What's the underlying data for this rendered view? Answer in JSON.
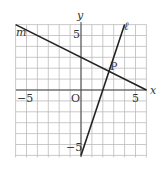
{
  "chart_data": {
    "type": "line",
    "title": "",
    "xlabel": "x",
    "ylabel": "y",
    "xlim": [
      -6,
      6
    ],
    "ylim": [
      -6,
      6
    ],
    "grid": true,
    "tick_labels": {
      "x_neg": "−5",
      "x_pos": "5",
      "y_pos": "5",
      "y_neg": "−5",
      "origin": "O"
    },
    "series": [
      {
        "name": "m",
        "equation": "y = -x/2 + 3",
        "points": [
          [
            -6,
            6
          ],
          [
            6,
            0
          ]
        ]
      },
      {
        "name": "ℓ",
        "equation": "y = 3x - 6",
        "points": [
          [
            0,
            -6
          ],
          [
            4,
            6
          ]
        ]
      }
    ],
    "annotations": [
      {
        "label": "P",
        "x": 2.57,
        "y": 1.71
      }
    ]
  },
  "labels": {
    "x_axis": "x",
    "y_axis": "y",
    "origin": "O",
    "x_neg": "−5",
    "x_pos": "5",
    "y_pos": "5",
    "y_neg": "−5",
    "line_m": "m",
    "line_l": "ℓ",
    "point_p": "P"
  }
}
